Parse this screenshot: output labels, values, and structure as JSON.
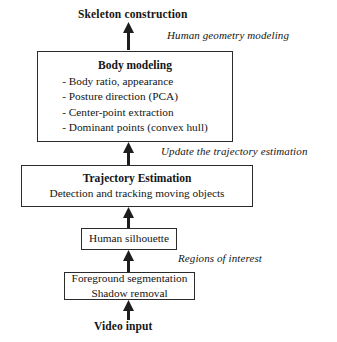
{
  "diagram": {
    "type": "flowchart",
    "orientation": "bottom-to-top",
    "colors": {
      "background": "#ffffff",
      "stroke": "#2b2b2b",
      "text": "#151515"
    },
    "top_label": "Skeleton construction",
    "bottom_label": "Video input",
    "nodes": [
      {
        "id": "body-modeling",
        "title": "Body modeling",
        "items": [
          "- Body ratio, appearance",
          "- Posture direction (PCA)",
          "- Center-point extraction",
          "- Dominant points (convex hull)"
        ]
      },
      {
        "id": "trajectory-estimation",
        "title": "Trajectory Estimation",
        "subtitle": "Detection and tracking moving objects"
      },
      {
        "id": "human-silhouette",
        "title": "Human silhouette"
      },
      {
        "id": "foreground-segmentation",
        "line1": "Foreground segmentation",
        "line2": "Shadow removal"
      }
    ],
    "edge_labels": [
      {
        "id": "human-geometry-modeling",
        "text": "Human geometry modeling"
      },
      {
        "id": "update-trajectory-estimation",
        "text": "Update the trajectory estimation"
      },
      {
        "id": "regions-of-interest",
        "text": "Regions of interest"
      }
    ]
  }
}
